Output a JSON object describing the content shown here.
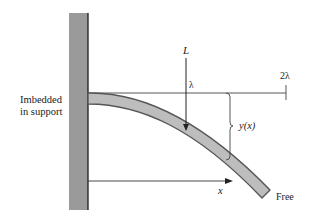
{
  "diagram": {
    "type": "cantilever-beam-deflection",
    "support_label_line1": "Imbedded",
    "support_label_line2": "in support",
    "load_label": "L",
    "load_position_label": "λ",
    "length_label": "2λ",
    "deflection_label": "y(x)",
    "x_axis_label": "x",
    "free_end_label": "Free",
    "colors": {
      "wall_fill": "#9a9a9a",
      "wall_edge": "#1a1a1a",
      "beam_fill": "#bdbdbd",
      "beam_edge": "#555555",
      "line": "#333333"
    }
  }
}
